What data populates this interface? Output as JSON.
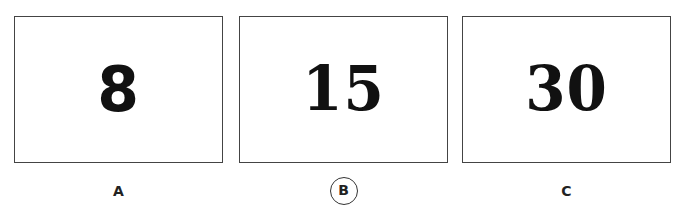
{
  "options": [
    {
      "number": "8",
      "label": "A",
      "selected": false
    },
    {
      "number": "15",
      "label": "B",
      "selected": true
    },
    {
      "number": "30",
      "label": "C",
      "selected": false
    }
  ],
  "colors": {
    "border": "#444444",
    "text": "#111111",
    "background": "#ffffff"
  }
}
